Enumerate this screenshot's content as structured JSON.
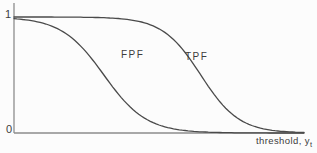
{
  "figure": {
    "y_tick_top": "1",
    "y_tick_bottom": "0",
    "fpf_label": "FPF",
    "tpf_label": "TPF",
    "x_axis_label": "threshold, y",
    "x_axis_label_subscript": "t"
  },
  "colors": {
    "background": "#fcfcfc",
    "curve": "#4a4a4a",
    "axis": "#8d8d8d",
    "text": "#3d3d3d"
  },
  "chart_data": {
    "type": "line",
    "title": "",
    "xlabel": "threshold, y_t",
    "ylabel": "",
    "xlim": [
      0,
      10
    ],
    "ylim": [
      0,
      1
    ],
    "y_ticks": [
      0,
      1
    ],
    "x_ticks": [],
    "grid": false,
    "legend_position": "inline-annotations",
    "x": [
      0,
      0.5,
      1,
      1.5,
      2,
      2.5,
      3,
      3.5,
      4,
      4.5,
      5,
      5.5,
      6,
      6.5,
      7,
      7.5,
      8,
      8.5,
      9,
      9.5,
      10
    ],
    "series": [
      {
        "name": "FPF",
        "model": {
          "type": "logistic-decreasing",
          "midpoint": 3.1,
          "scale": 0.73
        },
        "y": [
          0.986,
          0.972,
          0.947,
          0.899,
          0.819,
          0.694,
          0.534,
          0.366,
          0.226,
          0.128,
          0.069,
          0.036,
          0.019,
          0.009,
          0.005,
          0.002,
          0.001,
          0.001,
          0.0,
          0.0,
          0.0
        ]
      },
      {
        "name": "TPF",
        "model": {
          "type": "logistic-decreasing",
          "midpoint": 6.44,
          "scale": 0.66
        },
        "y": [
          1.0,
          1.0,
          1.0,
          0.999,
          0.999,
          0.998,
          0.995,
          0.988,
          0.976,
          0.95,
          0.899,
          0.806,
          0.661,
          0.477,
          0.3,
          0.167,
          0.086,
          0.042,
          0.02,
          0.01,
          0.005
        ]
      }
    ]
  }
}
